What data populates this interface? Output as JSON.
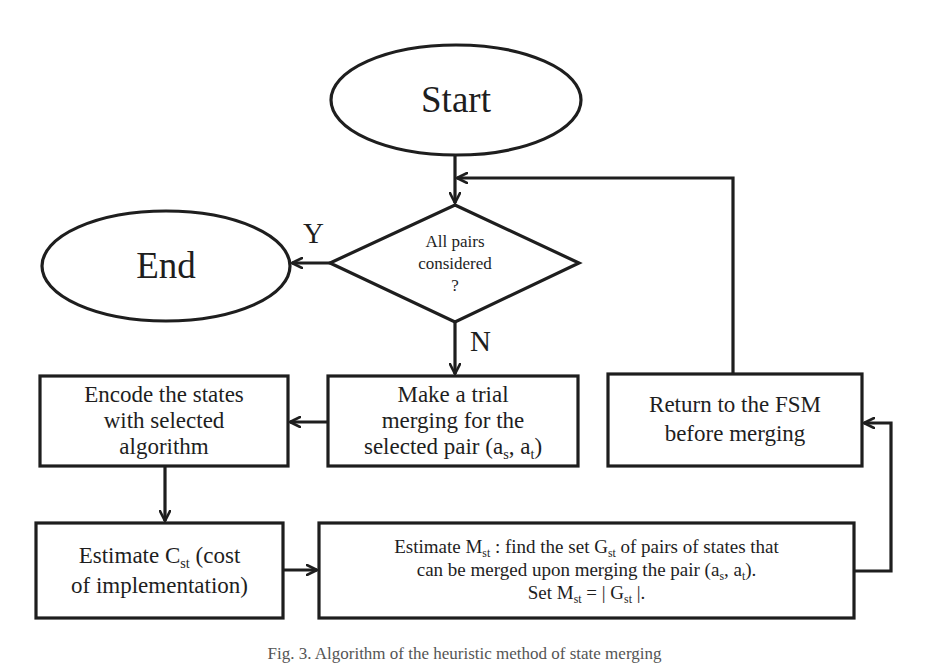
{
  "diagram": {
    "type": "flowchart",
    "stroke_color": "#1e1e1e",
    "background": "#ffffff",
    "nodes": {
      "start": {
        "shape": "ellipse",
        "label": "Start"
      },
      "end": {
        "shape": "ellipse",
        "label": "End"
      },
      "decision": {
        "shape": "diamond",
        "lines": [
          "All pairs",
          "considered",
          "?"
        ]
      },
      "encode": {
        "shape": "rectangle",
        "lines": [
          "Encode the states",
          "with selected",
          "algorithm"
        ]
      },
      "trial_merge": {
        "shape": "rectangle",
        "lines": [
          "Make a trial",
          "merging for the"
        ],
        "line3_prefix": "selected pair (a",
        "line3_sub1": "s",
        "line3_mid": ", a",
        "line3_sub2": "t",
        "line3_suffix": ")"
      },
      "return_fsm": {
        "shape": "rectangle",
        "lines": [
          "Return to the FSM",
          "before merging"
        ]
      },
      "estimate_c": {
        "shape": "rectangle",
        "line1_prefix": "Estimate C",
        "line1_sub": "st",
        "line1_suffix": " (cost",
        "line2": "of implementation)"
      },
      "estimate_m": {
        "shape": "rectangle",
        "l1_a": "Estimate M",
        "l1_sub1": "st",
        "l1_b": " : find the set G",
        "l1_sub2": "st",
        "l1_c": " of pairs of states that",
        "l2_a": "can be merged upon merging the pair (a",
        "l2_sub1": "s",
        "l2_b": ", a",
        "l2_sub2": "t",
        "l2_c": ").",
        "l3_a": "Set M",
        "l3_sub1": "st",
        "l3_b": " = | G",
        "l3_sub2": "st",
        "l3_c": " |."
      }
    },
    "edges": [
      {
        "from": "start",
        "to": "decision",
        "label": ""
      },
      {
        "from": "decision",
        "to": "end",
        "label": "Y"
      },
      {
        "from": "decision",
        "to": "trial_merge",
        "label": "N"
      },
      {
        "from": "trial_merge",
        "to": "encode",
        "label": ""
      },
      {
        "from": "encode",
        "to": "estimate_c",
        "label": ""
      },
      {
        "from": "estimate_c",
        "to": "estimate_m",
        "label": ""
      },
      {
        "from": "estimate_m",
        "to": "return_fsm",
        "label": ""
      },
      {
        "from": "return_fsm",
        "to": "decision",
        "label": ""
      }
    ],
    "edge_labels": {
      "yes": "Y",
      "no": "N"
    },
    "caption": "Fig. 3.   Algorithm of the heuristic method of state merging"
  }
}
